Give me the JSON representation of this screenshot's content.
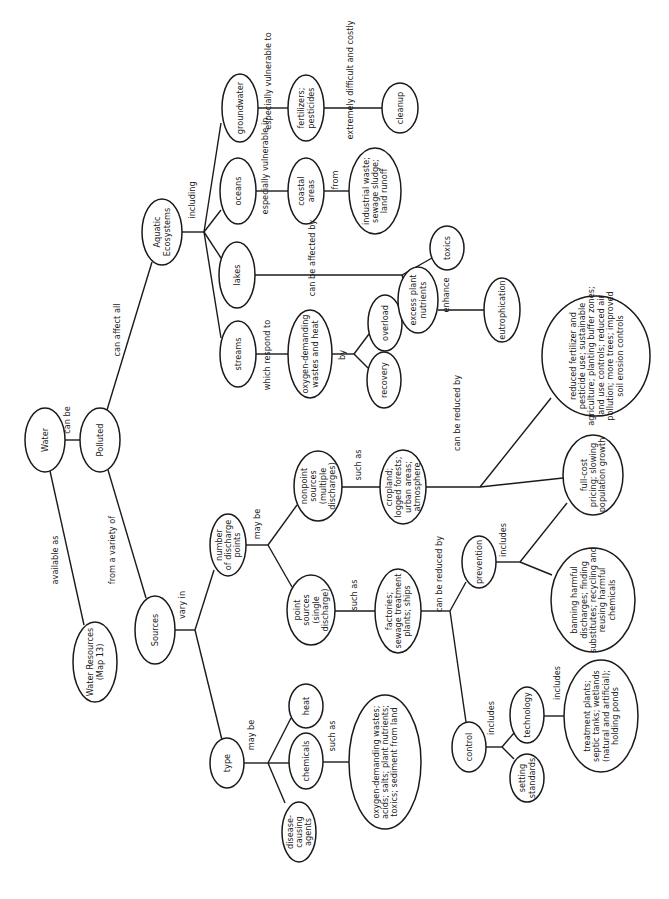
{
  "diagram": {
    "orientation": "rotated-90-clockwise",
    "nodes": [
      {
        "id": "water",
        "lines": [
          "Water"
        ],
        "x": 45,
        "y": 440,
        "rx": 20,
        "ry": 32
      },
      {
        "id": "polluted",
        "lines": [
          "Polluted"
        ],
        "x": 100,
        "y": 440,
        "rx": 20,
        "ry": 32
      },
      {
        "id": "water_resources",
        "lines": [
          "Water Resources",
          "(Map 13)"
        ],
        "x": 95,
        "y": 662,
        "rx": 22,
        "ry": 40
      },
      {
        "id": "sources",
        "lines": [
          "Sources"
        ],
        "x": 155,
        "y": 630,
        "rx": 20,
        "ry": 34
      },
      {
        "id": "aquatic",
        "lines": [
          "Aquatic",
          "Ecosystems"
        ],
        "x": 162,
        "y": 232,
        "rx": 20,
        "ry": 33
      },
      {
        "id": "streams",
        "lines": [
          "streams"
        ],
        "x": 238,
        "y": 354,
        "rx": 18,
        "ry": 33
      },
      {
        "id": "lakes",
        "lines": [
          "lakes"
        ],
        "x": 237,
        "y": 275,
        "rx": 18,
        "ry": 33
      },
      {
        "id": "oceans",
        "lines": [
          "oceans"
        ],
        "x": 238,
        "y": 191,
        "rx": 18,
        "ry": 33
      },
      {
        "id": "groundwater",
        "lines": [
          "groundwater"
        ],
        "x": 240,
        "y": 108,
        "rx": 18,
        "ry": 34
      },
      {
        "id": "oxygen_heat",
        "lines": [
          "oxygen-demanding",
          "wastes and heat"
        ],
        "x": 310,
        "y": 354,
        "rx": 22,
        "ry": 44
      },
      {
        "id": "recovery",
        "lines": [
          "recovery"
        ],
        "x": 384,
        "y": 380,
        "rx": 17,
        "ry": 28
      },
      {
        "id": "overload",
        "lines": [
          "overload"
        ],
        "x": 385,
        "y": 323,
        "rx": 17,
        "ry": 28
      },
      {
        "id": "excess_nutrients",
        "lines": [
          "excess plant",
          "nutrients"
        ],
        "x": 418,
        "y": 300,
        "rx": 20,
        "ry": 33
      },
      {
        "id": "toxics",
        "lines": [
          "toxics"
        ],
        "x": 447,
        "y": 248,
        "rx": 17,
        "ry": 22
      },
      {
        "id": "eutrophication",
        "lines": [
          "eutrophication"
        ],
        "x": 502,
        "y": 310,
        "rx": 18,
        "ry": 32
      },
      {
        "id": "coastal",
        "lines": [
          "coastal",
          "areas"
        ],
        "x": 306,
        "y": 191,
        "rx": 18,
        "ry": 33
      },
      {
        "id": "industrial",
        "lines": [
          "industrial waste;",
          "sewage sludge;",
          "land runoff"
        ],
        "x": 375,
        "y": 191,
        "rx": 26,
        "ry": 43
      },
      {
        "id": "fertilizers",
        "lines": [
          "fertilizers;",
          "pesticides"
        ],
        "x": 306,
        "y": 108,
        "rx": 18,
        "ry": 33
      },
      {
        "id": "cleanup",
        "lines": [
          "cleanup"
        ],
        "x": 400,
        "y": 108,
        "rx": 18,
        "ry": 25
      },
      {
        "id": "num_discharge",
        "lines": [
          "number",
          "of discharge",
          "points"
        ],
        "x": 228,
        "y": 545,
        "rx": 18,
        "ry": 31
      },
      {
        "id": "nonpoint",
        "lines": [
          "nonpoint",
          "sources",
          "(multiple",
          "discharges)"
        ],
        "x": 318,
        "y": 486,
        "rx": 24,
        "ry": 35
      },
      {
        "id": "point",
        "lines": [
          "point",
          "sources",
          "(single",
          "discharge)"
        ],
        "x": 311,
        "y": 610,
        "rx": 24,
        "ry": 35
      },
      {
        "id": "cropland",
        "lines": [
          "cropland;",
          "logged forests;",
          "urban areas;",
          "atmosphere"
        ],
        "x": 403,
        "y": 487,
        "rx": 23,
        "ry": 37
      },
      {
        "id": "factories",
        "lines": [
          "factories;",
          "sewage treatment",
          "plants; ships"
        ],
        "x": 398,
        "y": 611,
        "rx": 23,
        "ry": 42
      },
      {
        "id": "reduced",
        "lines": [
          "reduced fertilizer and",
          "pesticide use; sustainable",
          "agriculture; planting buffer zones;",
          "land use controls; reduced air",
          "pollution; more trees; improved",
          "soil erosion controls"
        ],
        "x": 596,
        "y": 356,
        "rx": 54,
        "ry": 60
      },
      {
        "id": "fullcost",
        "lines": [
          "full-cost",
          "pricing; slowing",
          "population growth"
        ],
        "x": 593,
        "y": 475,
        "rx": 30,
        "ry": 40
      },
      {
        "id": "prevention",
        "lines": [
          "prevention"
        ],
        "x": 479,
        "y": 562,
        "rx": 17,
        "ry": 26
      },
      {
        "id": "banning",
        "lines": [
          "banning harmful",
          "discharges; finding",
          "substitutes; recycling and",
          "reusing harmful",
          "chemicals"
        ],
        "x": 593,
        "y": 600,
        "rx": 42,
        "ry": 52
      },
      {
        "id": "control",
        "lines": [
          "control"
        ],
        "x": 469,
        "y": 747,
        "rx": 17,
        "ry": 25
      },
      {
        "id": "setting_standards",
        "lines": [
          "setting",
          "standards"
        ],
        "x": 527,
        "y": 778,
        "rx": 17,
        "ry": 24
      },
      {
        "id": "technology",
        "lines": [
          "technology"
        ],
        "x": 527,
        "y": 715,
        "rx": 17,
        "ry": 28
      },
      {
        "id": "treatment_plants",
        "lines": [
          "treatment plants;",
          "septic tanks; wetlands",
          "(natural and artificial);",
          "holding ponds"
        ],
        "x": 601,
        "y": 716,
        "rx": 37,
        "ry": 56
      },
      {
        "id": "type",
        "lines": [
          "type"
        ],
        "x": 227,
        "y": 763,
        "rx": 17,
        "ry": 25
      },
      {
        "id": "disease",
        "lines": [
          "disease-",
          "causing",
          "agents"
        ],
        "x": 299,
        "y": 832,
        "rx": 17,
        "ry": 30
      },
      {
        "id": "chemicals",
        "lines": [
          "chemicals"
        ],
        "x": 306,
        "y": 761,
        "rx": 17,
        "ry": 28
      },
      {
        "id": "heat",
        "lines": [
          "heat"
        ],
        "x": 306,
        "y": 706,
        "rx": 17,
        "ry": 22
      },
      {
        "id": "oxygen_acids",
        "lines": [
          "oxygen-demanding wastes;",
          "acids; salts; plant nutrients;",
          "toxics; sediment from land"
        ],
        "x": 385,
        "y": 762,
        "rx": 36,
        "ry": 67
      }
    ],
    "links": [
      {
        "label": "can be",
        "x": 70,
        "y": 420
      },
      {
        "label": "available as",
        "x": 58,
        "y": 560
      },
      {
        "label": "can affect all",
        "x": 120,
        "y": 330
      },
      {
        "label": "from a variety of",
        "x": 115,
        "y": 550
      },
      {
        "label": "including",
        "x": 195,
        "y": 200
      },
      {
        "label": "which respond to",
        "x": 270,
        "y": 355
      },
      {
        "label": "by",
        "x": 345,
        "y": 355
      },
      {
        "label": "can be affected by",
        "x": 315,
        "y": 258
      },
      {
        "label": "enhance",
        "x": 449,
        "y": 295
      },
      {
        "label": "especially vulnerable in",
        "x": 268,
        "y": 166
      },
      {
        "label": "from",
        "x": 338,
        "y": 180
      },
      {
        "label": "especially vulnerable to",
        "x": 271,
        "y": 81
      },
      {
        "label": "extremely difficult and costly",
        "x": 353,
        "y": 80
      },
      {
        "label": "vary in",
        "x": 185,
        "y": 605
      },
      {
        "label": "may be",
        "x": 260,
        "y": 524
      },
      {
        "label": "such as",
        "x": 361,
        "y": 465
      },
      {
        "label": "such as",
        "x": 357,
        "y": 595
      },
      {
        "label": "can be reduced by",
        "x": 460,
        "y": 413
      },
      {
        "label": "can be reduced by",
        "x": 442,
        "y": 574
      },
      {
        "label": "includes",
        "x": 506,
        "y": 540
      },
      {
        "label": "includes",
        "x": 494,
        "y": 718
      },
      {
        "label": "includes",
        "x": 560,
        "y": 683
      },
      {
        "label": "may be",
        "x": 254,
        "y": 735
      },
      {
        "label": "such as",
        "x": 335,
        "y": 736
      }
    ]
  }
}
